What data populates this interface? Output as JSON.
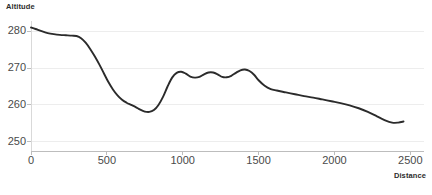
{
  "chart_data": {
    "type": "line",
    "title": "Altitude",
    "xlabel": "Distance",
    "ylabel": "Altitude",
    "xlim": [
      0,
      2590
    ],
    "ylim": [
      247.5,
      282.5
    ],
    "xticks": [
      0,
      500,
      1000,
      1500,
      2000,
      2500
    ],
    "xtick_labels": [
      "0",
      "500",
      "1000",
      "1500",
      "2000",
      "2500"
    ],
    "yticks": [
      250,
      260,
      270,
      280
    ],
    "ytick_labels": [
      "250",
      "260",
      "270",
      "280"
    ],
    "grid": "horizontal",
    "legend": "none",
    "line_color": "#2b2b2b",
    "line_width": 1.9,
    "series": [
      {
        "name": "Altitude",
        "x": [
          0,
          30,
          70,
          110,
          150,
          190,
          230,
          270,
          300,
          330,
          360,
          390,
          420,
          450,
          480,
          510,
          540,
          570,
          600,
          630,
          660,
          690,
          720,
          750,
          780,
          810,
          840,
          870,
          900,
          930,
          960,
          990,
          1020,
          1050,
          1080,
          1110,
          1140,
          1170,
          1200,
          1230,
          1260,
          1290,
          1320,
          1350,
          1380,
          1410,
          1440,
          1470,
          1500,
          1540,
          1580,
          1620,
          1680,
          1740,
          1800,
          1860,
          1920,
          1980,
          2040,
          2100,
          2160,
          2220,
          2280,
          2330,
          2380,
          2420,
          2455
        ],
        "y": [
          281.0,
          280.6,
          280.0,
          279.5,
          279.2,
          279.0,
          278.9,
          278.8,
          278.7,
          278.1,
          276.9,
          275.2,
          273.2,
          271.0,
          268.6,
          266.2,
          264.2,
          262.6,
          261.4,
          260.6,
          260.0,
          259.4,
          258.7,
          258.2,
          258.1,
          258.6,
          260.0,
          262.2,
          265.0,
          267.4,
          268.7,
          269.0,
          268.5,
          267.7,
          267.4,
          267.6,
          268.3,
          268.8,
          268.8,
          268.3,
          267.6,
          267.5,
          267.9,
          268.7,
          269.4,
          269.6,
          269.2,
          268.2,
          266.7,
          265.2,
          264.3,
          263.9,
          263.4,
          262.9,
          262.4,
          262.0,
          261.5,
          261.0,
          260.5,
          259.9,
          259.1,
          258.1,
          256.9,
          255.9,
          255.2,
          255.2,
          255.5
        ]
      }
    ]
  },
  "footer": {
    "left_text": "",
    "right_text": ""
  }
}
